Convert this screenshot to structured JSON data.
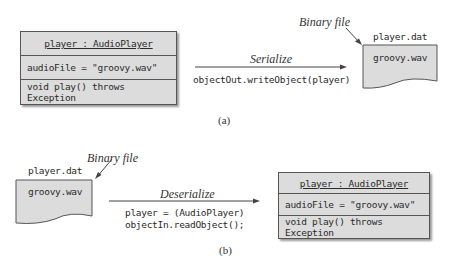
{
  "part_a": {
    "object_box": {
      "title": "player : AudioPlayer",
      "attribute": "audioFile = \"groovy.wav\"",
      "method": "void play() throws Exception"
    },
    "arrow_label": "Serialize",
    "code": "objectOut.writeObject(player)",
    "file": {
      "name": "player.dat",
      "content": "groovy.wav",
      "callout": "Binary file"
    },
    "caption": "(a)"
  },
  "part_b": {
    "file": {
      "name": "player.dat",
      "content": "groovy.wav",
      "callout": "Binary file"
    },
    "arrow_label": "Deserialize",
    "code_line1": "player = (AudioPlayer)",
    "code_line2": "objectIn.readObject();",
    "object_box": {
      "title": "player : AudioPlayer",
      "attribute": "audioFile = \"groovy.wav\"",
      "method": "void play() throws Exception"
    },
    "caption": "(b)"
  },
  "colors": {
    "box_fill": "#dcdcdc",
    "line": "#555555"
  }
}
